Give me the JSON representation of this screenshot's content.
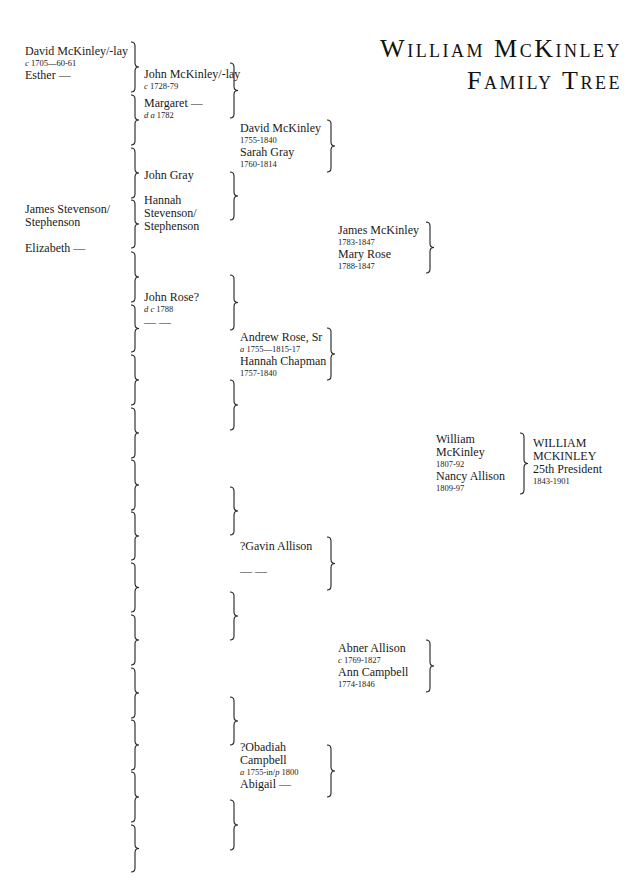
{
  "title": {
    "line1": "William McKinley",
    "line2": "Family Tree"
  },
  "generation1": {
    "david_mckinley_lay": {
      "name": "David McKinley/-lay",
      "date_prefix": "c",
      "dates": "1705—60-61"
    },
    "esther": {
      "name": "Esther —"
    },
    "james_stevenson": {
      "name_line1": "James Stevenson/",
      "name_line2": "Stephenson"
    },
    "elizabeth": {
      "name": "Elizabeth —"
    }
  },
  "generation2": {
    "john_mckinley_lay": {
      "name": "John McKinley/-lay",
      "date_prefix": "c",
      "dates": "1728-79"
    },
    "margaret": {
      "name": "Margaret —",
      "date_prefix": "d a",
      "dates": "1782"
    },
    "john_gray": {
      "name": "John Gray"
    },
    "hannah_stevenson": {
      "name_line1": "Hannah",
      "name_line2": "Stevenson/",
      "name_line3": "Stephenson"
    },
    "john_rose": {
      "name": "John Rose?",
      "date_prefix": "d c",
      "dates": "1788"
    },
    "unknown_spouse": {
      "name": "— —"
    }
  },
  "generation3": {
    "david_mckinley": {
      "name": "David McKinley",
      "dates": "1755-1840"
    },
    "sarah_gray": {
      "name": "Sarah Gray",
      "dates": "1760-1814"
    },
    "andrew_rose": {
      "name": "Andrew Rose, Sr",
      "date_prefix": "a",
      "dates": "1755—1815-17"
    },
    "hannah_chapman": {
      "name": "Hannah Chapman",
      "dates": "1757-1840"
    },
    "gavin_allison": {
      "name": "?Gavin Allison"
    },
    "gavin_spouse": {
      "name": "— —"
    },
    "obadiah_campbell": {
      "name_line1": "?Obadiah",
      "name_line2": "Campbell",
      "date_prefix": "a",
      "dates": "1755-in/",
      "date_prefix2": "p",
      "dates2": "1800"
    },
    "abigail": {
      "name": "Abigail —"
    }
  },
  "generation4": {
    "james_mckinley": {
      "name": "James McKinley",
      "dates": "1783-1847"
    },
    "mary_rose": {
      "name": "Mary Rose",
      "dates": "1788-1847"
    },
    "abner_allison": {
      "name": "Abner Allison",
      "date_prefix": "c",
      "dates": "1769-1827"
    },
    "ann_campbell": {
      "name": "Ann Campbell",
      "dates": "1774-1846"
    }
  },
  "generation5": {
    "william_mckinley_sr": {
      "name_line1": "William",
      "name_line2": "McKinley",
      "dates": "1807-92"
    },
    "nancy_allison": {
      "name": "Nancy Allison",
      "dates": "1809-97"
    }
  },
  "subject": {
    "name_line1": "WILLIAM",
    "name_line2": "MCKINLEY",
    "title": "25th President",
    "dates": "1843-1901"
  },
  "brackets": {
    "col1_x": 131,
    "col1": [
      [
        42,
        92
      ],
      [
        95,
        145
      ],
      [
        148,
        198
      ],
      [
        200,
        248
      ],
      [
        252,
        302
      ],
      [
        305,
        352
      ],
      [
        355,
        405
      ],
      [
        408,
        458
      ],
      [
        460,
        510
      ],
      [
        512,
        560
      ],
      [
        563,
        612
      ],
      [
        615,
        665
      ],
      [
        668,
        718
      ],
      [
        720,
        770
      ],
      [
        772,
        822
      ],
      [
        825,
        872
      ]
    ],
    "col2_x": 230,
    "col2": [
      [
        63,
        118
      ],
      [
        172,
        220
      ],
      [
        275,
        330
      ],
      [
        380,
        430
      ],
      [
        487,
        535
      ],
      [
        592,
        640
      ],
      [
        697,
        745
      ],
      [
        800,
        850
      ]
    ],
    "col3_x": 327,
    "col3": [
      [
        120,
        172
      ],
      [
        328,
        380
      ],
      [
        537,
        590
      ],
      [
        745,
        797
      ]
    ],
    "col4_x": 426,
    "col4": [
      [
        222,
        273
      ],
      [
        640,
        692
      ]
    ],
    "col5_x": 520,
    "col5": [
      [
        433,
        494
      ]
    ]
  }
}
